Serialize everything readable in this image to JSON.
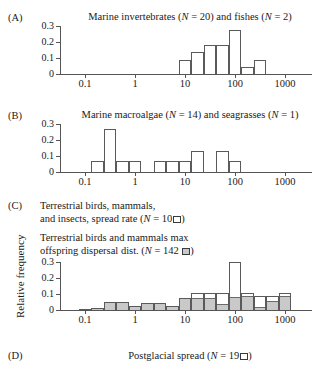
{
  "figure": {
    "ylabel": "Relative frequency"
  },
  "panels": {
    "a": {
      "tag": "(A)",
      "title_parts": {
        "t1": "Marine invertebrates (",
        "n1": "N",
        "t2": " = 20) and fishes (",
        "n2": "N",
        "t3": " = 2)"
      },
      "yticks": [
        "0",
        "0.1",
        "0.2",
        "0.3"
      ],
      "xticks": [
        "0.1",
        "1",
        "10",
        "100",
        "1000"
      ]
    },
    "b": {
      "tag": "(B)",
      "title_parts": {
        "t1": "Marine macroalgae (",
        "n1": "N",
        "t2": " = 14) and seagrasses (",
        "n2": "N",
        "t3": " = 1)"
      },
      "yticks": [
        "0",
        "0.1",
        "0.2",
        "0.3"
      ],
      "xticks": [
        "0.1",
        "1",
        "10",
        "100",
        "1000"
      ]
    },
    "c": {
      "tag": "(C)",
      "title_line1": "Terrestrial birds, mammals,",
      "title_line2_a": "and insects, spread rate (",
      "title_line2_n": "N",
      "title_line2_b": " = 10",
      "title_line2_c": ")",
      "title_line3": "Terrestrial birds and mammals max",
      "title_line4_a": "offspring dispersal dist. (",
      "title_line4_n": "N",
      "title_line4_b": " = 142 ",
      "title_line4_c": ")",
      "yticks": [
        "0",
        "0.1",
        "0.2",
        "0.3"
      ],
      "xticks": [
        "0.1",
        "1",
        "10",
        "100",
        "1000"
      ]
    },
    "d": {
      "tag": "(D)",
      "title_a": "Postglacial spread (",
      "title_n": "N",
      "title_b": " = 19",
      "title_c": ")"
    }
  },
  "chart_data": [
    {
      "type": "bar",
      "panel": "A",
      "title": "Marine invertebrates (N = 20) and fishes (N = 2)",
      "xlabel": "",
      "ylabel": "Relative frequency",
      "xscale": "log10",
      "xlim": [
        0.02,
        3000
      ],
      "ylim": [
        0,
        0.3
      ],
      "xtick_values": [
        0.1,
        1,
        10,
        100,
        1000
      ],
      "xtick_labels": [
        "0.1",
        "1",
        "10",
        "100",
        "1000"
      ],
      "ytick_values": [
        0,
        0.1,
        0.2,
        0.3
      ],
      "ytick_labels": [
        "0",
        "0.1",
        "0.2",
        "0.3"
      ],
      "grid": false,
      "legend": false,
      "bin_width_decades": 0.25,
      "series": [
        {
          "name": "Marine invertebrates and fishes",
          "style": "open",
          "bins_log10_left": [
            0.875,
            1.125,
            1.375,
            1.625,
            1.875,
            2.125,
            2.375
          ],
          "values": [
            0.09,
            0.14,
            0.18,
            0.18,
            0.275,
            0.045,
            0.09
          ]
        }
      ]
    },
    {
      "type": "bar",
      "panel": "B",
      "title": "Marine macroalgae (N = 14) and seagrasses (N = 1)",
      "xlabel": "",
      "ylabel": "Relative frequency",
      "xscale": "log10",
      "xlim": [
        0.02,
        3000
      ],
      "ylim": [
        0,
        0.3
      ],
      "xtick_values": [
        0.1,
        1,
        10,
        100,
        1000
      ],
      "xtick_labels": [
        "0.1",
        "1",
        "10",
        "100",
        "1000"
      ],
      "ytick_values": [
        0,
        0.1,
        0.2,
        0.3
      ],
      "ytick_labels": [
        "0",
        "0.1",
        "0.2",
        "0.3"
      ],
      "grid": false,
      "legend": false,
      "bin_width_decades": 0.25,
      "series": [
        {
          "name": "Marine macroalgae and seagrasses",
          "style": "open",
          "bins_log10_left": [
            -0.875,
            -0.625,
            -0.375,
            -0.125,
            0.375,
            0.625,
            0.875,
            1.125,
            1.625,
            1.875
          ],
          "values": [
            0.067,
            0.267,
            0.067,
            0.067,
            0.067,
            0.067,
            0.067,
            0.133,
            0.133,
            0.067
          ]
        }
      ]
    },
    {
      "type": "bar",
      "panel": "C",
      "title": "Terrestrial birds, mammals, and insects, spread rate (N = 10); Terrestrial birds and mammals max offspring dispersal dist. (N = 142)",
      "xlabel": "",
      "ylabel": "Relative frequency",
      "xscale": "log10",
      "xlim": [
        0.02,
        3000
      ],
      "ylim": [
        0,
        0.3
      ],
      "xtick_values": [
        0.1,
        1,
        10,
        100,
        1000
      ],
      "xtick_labels": [
        "0.1",
        "1",
        "10",
        "100",
        "1000"
      ],
      "ytick_values": [
        0,
        0.1,
        0.2,
        0.3
      ],
      "ytick_labels": [
        "0",
        "0.1",
        "0.2",
        "0.3"
      ],
      "grid": false,
      "legend": true,
      "legend_entries": [
        {
          "label": "Terrestrial birds, mammals, and insects, spread rate (N = 10)",
          "style": "open"
        },
        {
          "label": "Terrestrial birds and mammals max offspring dispersal dist. (N = 142)",
          "style": "grey"
        }
      ],
      "bin_width_decades": 0.25,
      "series": [
        {
          "name": "Spread rate (N = 10, open)",
          "style": "open",
          "bins_log10_left": [
            -1.125,
            -0.875,
            -0.625,
            -0.375,
            -0.125,
            0.125,
            0.375,
            0.625,
            0.875,
            1.125,
            1.375,
            1.625,
            1.875,
            2.125,
            2.375,
            2.625,
            2.875
          ],
          "values": [
            0.004,
            0.012,
            0.048,
            0.048,
            0.025,
            0.043,
            0.043,
            0.027,
            0.072,
            0.105,
            0.105,
            0.105,
            0.3,
            0.105,
            0.085,
            0.09,
            0.105
          ]
        },
        {
          "name": "Max offspring dispersal distance (N = 142, grey)",
          "style": "grey",
          "bins_log10_left": [
            -1.125,
            -0.875,
            -0.625,
            -0.375,
            -0.125,
            0.125,
            0.375,
            0.625,
            0.875,
            1.125,
            1.375,
            1.625,
            1.875,
            2.125,
            2.375,
            2.625,
            2.875
          ],
          "values": [
            0.004,
            0.012,
            0.048,
            0.048,
            0.025,
            0.043,
            0.043,
            0.027,
            0.072,
            0.072,
            0.072,
            0.035,
            0.082,
            0.088,
            0.018,
            0.057,
            0.088
          ]
        }
      ]
    }
  ]
}
